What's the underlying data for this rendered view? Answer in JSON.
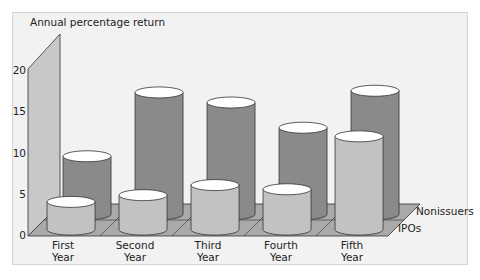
{
  "chart_data": {
    "type": "bar",
    "style": "3d-cylinder",
    "title": "",
    "ylabel": "Annual percentage return",
    "xlabel": "",
    "ylim": [
      0,
      20
    ],
    "yticks": [
      "0",
      "5",
      "10",
      "15",
      "20"
    ],
    "grid": false,
    "legend_position": "right-depth-labels",
    "categories": [
      {
        "line1": "First",
        "line2": "Year"
      },
      {
        "line1": "Second",
        "line2": "Year"
      },
      {
        "line1": "Third",
        "line2": "Year"
      },
      {
        "line1": "Fourth",
        "line2": "Year"
      },
      {
        "line1": "Fifth",
        "line2": "Year"
      }
    ],
    "series": [
      {
        "name": "IPOs",
        "values": [
          3.3,
          4.1,
          5.3,
          4.8,
          11.1
        ],
        "color": "#c2c2c2"
      },
      {
        "name": "Nonissuers",
        "values": [
          6.9,
          14.5,
          13.3,
          10.3,
          14.7
        ],
        "color": "#8a8a8a"
      }
    ]
  },
  "colors": {
    "background": "#f2f2f2",
    "wall": "#c8c8c8",
    "floor": "#aaaaaa",
    "outline": "#333333",
    "cap": "#ffffff"
  }
}
